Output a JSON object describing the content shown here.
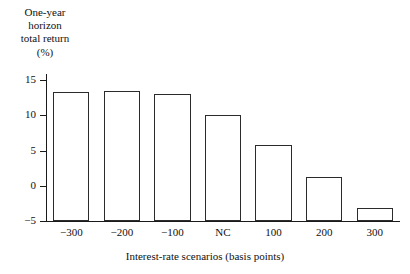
{
  "chart_data": {
    "type": "bar",
    "title": "",
    "subtitle": "",
    "xlabel": "Interest-rate scenarios (basis points)",
    "ylabel": "One-year horizon total return (%)",
    "ylabel_lines": [
      "One-year",
      "horizon",
      "total return",
      "(%)"
    ],
    "categories": [
      "−300",
      "−200",
      "−100",
      "NC",
      "100",
      "200",
      "300"
    ],
    "values": [
      13.3,
      13.5,
      13.0,
      10.0,
      5.8,
      1.3,
      -3.2
    ],
    "yticks": [
      15,
      10,
      5,
      0,
      -5
    ],
    "ytick_labels": [
      "15",
      "10",
      "5",
      "0",
      "−5"
    ],
    "ylim": [
      -5,
      15
    ],
    "grid": false,
    "legend": null,
    "bar_fill_color": "#ffffff",
    "bar_edge_color": "#2b2b2b",
    "axis_color": "#1a1a1a",
    "background_color": "#ffffff"
  }
}
